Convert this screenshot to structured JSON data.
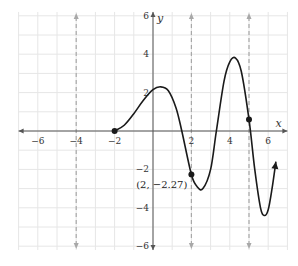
{
  "chart_data": {
    "type": "line",
    "title": "",
    "xlabel": "x",
    "ylabel": "y",
    "xlim": [
      -7,
      7
    ],
    "ylim": [
      -6.2,
      6.2
    ],
    "grid": true,
    "x_ticks": [
      -6,
      -4,
      -2,
      2,
      4,
      6
    ],
    "y_ticks": [
      6,
      4,
      2,
      -2,
      -4,
      -6
    ],
    "x_tick_labels": [
      "−6",
      "−4",
      "−2",
      "2",
      "4",
      "6"
    ],
    "y_tick_labels": [
      "6",
      "4",
      "2",
      "−2",
      "−4",
      "−6"
    ],
    "vertical_asymptotes_dashed": [
      -4,
      2,
      5
    ],
    "series": [
      {
        "name": "f(x)",
        "points": [
          {
            "x": -2,
            "y": 0
          },
          {
            "x": -1.5,
            "y": 0.3
          },
          {
            "x": -1,
            "y": 0.9
          },
          {
            "x": -0.5,
            "y": 1.6
          },
          {
            "x": 0,
            "y": 2.15
          },
          {
            "x": 0.4,
            "y": 2.3
          },
          {
            "x": 0.8,
            "y": 2.1
          },
          {
            "x": 1.2,
            "y": 1.2
          },
          {
            "x": 1.5,
            "y": 0
          },
          {
            "x": 2,
            "y": -2.27
          },
          {
            "x": 2.3,
            "y": -2.9
          },
          {
            "x": 2.6,
            "y": -3.0
          },
          {
            "x": 3,
            "y": -2.0
          },
          {
            "x": 3.3,
            "y": 0
          },
          {
            "x": 3.7,
            "y": 2.6
          },
          {
            "x": 4,
            "y": 3.6
          },
          {
            "x": 4.3,
            "y": 3.8
          },
          {
            "x": 4.6,
            "y": 3.1
          },
          {
            "x": 5,
            "y": 0.6
          },
          {
            "x": 5.3,
            "y": -2.0
          },
          {
            "x": 5.6,
            "y": -4.0
          },
          {
            "x": 5.8,
            "y": -4.4
          },
          {
            "x": 6.0,
            "y": -4.1
          },
          {
            "x": 6.2,
            "y": -3.0
          },
          {
            "x": 6.4,
            "y": -1.6
          }
        ],
        "end_arrow": true
      }
    ],
    "marked_points": [
      {
        "x": -2,
        "y": 0
      },
      {
        "x": 2,
        "y": -2.27
      },
      {
        "x": 5,
        "y": 0.6
      }
    ],
    "annotations": [
      {
        "text": "(2, −2.27)",
        "x": 2,
        "y": -2.27
      }
    ]
  },
  "style": {
    "curve_color": "#1a1a1a",
    "axis_color": "#555555",
    "grid_color": "#e6e6e6",
    "asymptote_color": "#a8a8a8"
  }
}
